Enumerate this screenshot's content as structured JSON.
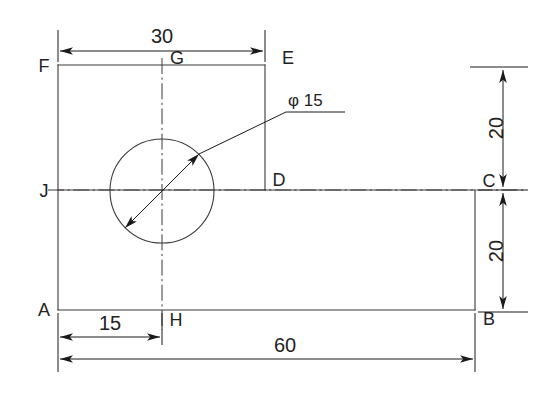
{
  "drawing": {
    "title": "Engineering part outline with hole",
    "units_note": "",
    "line_color": "#3a3a3a",
    "text_color": "#222222"
  },
  "vertices": [
    {
      "id": "A",
      "label": "A",
      "x": 58,
      "y": 310
    },
    {
      "id": "B",
      "label": "B",
      "x": 475,
      "y": 310
    },
    {
      "id": "C",
      "label": "C",
      "x": 475,
      "y": 190
    },
    {
      "id": "D",
      "label": "D",
      "x": 265,
      "y": 190
    },
    {
      "id": "E",
      "label": "E",
      "x": 265,
      "y": 65
    },
    {
      "id": "F",
      "label": "F",
      "x": 58,
      "y": 65
    },
    {
      "id": "G",
      "label": "G",
      "x": 162,
      "y": 65
    },
    {
      "id": "H",
      "label": "H",
      "x": 162,
      "y": 310
    },
    {
      "id": "J",
      "label": "J",
      "x": 58,
      "y": 190
    }
  ],
  "hole": {
    "label": "φ 15",
    "diameter": 15,
    "center_x": 162,
    "center_y": 191,
    "radius_px": 52
  },
  "dimensions": [
    {
      "name": "width-30",
      "value": "30",
      "orientation": "horizontal"
    },
    {
      "name": "height-20-top",
      "value": "20",
      "orientation": "vertical"
    },
    {
      "name": "height-20-bottom",
      "value": "20",
      "orientation": "vertical"
    },
    {
      "name": "width-15",
      "value": "15",
      "orientation": "horizontal"
    },
    {
      "name": "width-60",
      "value": "60",
      "orientation": "horizontal"
    }
  ],
  "labels": {
    "dim_30": "30",
    "dim_20_top": "20",
    "dim_20_bottom": "20",
    "dim_15": "15",
    "dim_60": "60",
    "hole_callout": "φ 15",
    "A": "A",
    "B": "B",
    "C": "C",
    "D": "D",
    "E": "E",
    "F": "F",
    "G": "G",
    "H": "H",
    "J": "J"
  }
}
